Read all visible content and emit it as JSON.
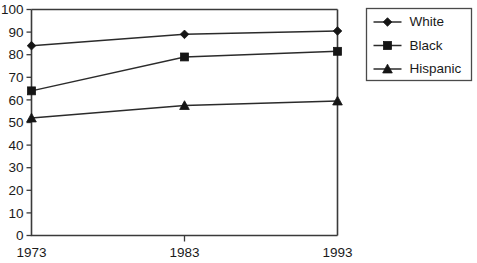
{
  "chart_data": {
    "type": "line",
    "title": "",
    "xlabel": "",
    "ylabel": "",
    "x": [
      "1973",
      "1983",
      "1993"
    ],
    "categories": [
      "1973",
      "1983",
      "1993"
    ],
    "series": [
      {
        "name": "White",
        "marker": "diamond",
        "values": [
          84,
          89,
          90.5
        ]
      },
      {
        "name": "Black",
        "marker": "square",
        "values": [
          64,
          79,
          81.5
        ]
      },
      {
        "name": "Hispanic",
        "marker": "triangle",
        "values": [
          52,
          57.5,
          59.5
        ]
      }
    ],
    "ylim": [
      0,
      100
    ],
    "ytick_labels": [
      "0",
      "10",
      "20",
      "30",
      "40",
      "50",
      "60",
      "70",
      "80",
      "90",
      "100"
    ],
    "ytick_values": [
      0,
      10,
      20,
      30,
      40,
      50,
      60,
      70,
      80,
      90,
      100
    ],
    "xtick_labels": [
      "1973",
      "1983",
      "1993"
    ],
    "grid": false,
    "legend_position": "right",
    "legend_entries": [
      {
        "label": "White",
        "marker": "diamond"
      },
      {
        "label": "Black",
        "marker": "square"
      },
      {
        "label": "Hispanic",
        "marker": "triangle"
      }
    ],
    "colors": {
      "line": "#2b2b2b",
      "marker": "#151515",
      "axis": "#3a3a3a",
      "background": "#ffffff",
      "legend_border": "#4a4a4a"
    }
  }
}
